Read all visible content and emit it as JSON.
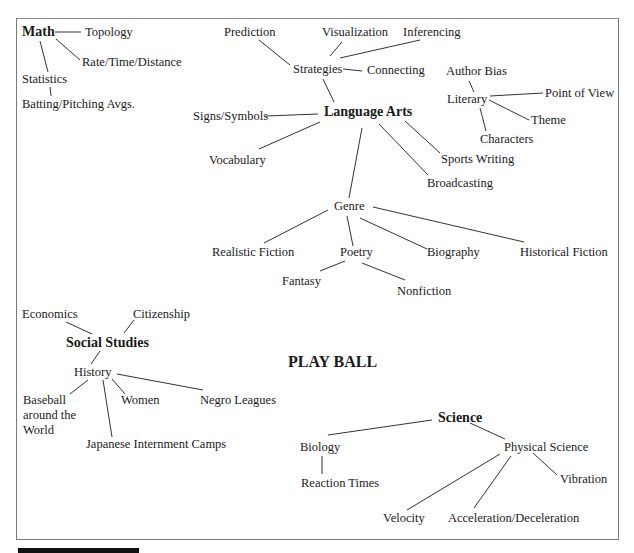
{
  "title": "PLAY BALL",
  "subjects": {
    "math": {
      "label": "Math",
      "children": [
        "Topology",
        "Rate/Time/Distance",
        "Statistics",
        "Batting/Pitching Avgs."
      ]
    },
    "language_arts": {
      "label": "Language Arts",
      "strategies": {
        "label": "Strategies",
        "children": [
          "Prediction",
          "Visualization",
          "Inferencing",
          "Connecting"
        ]
      },
      "literary": {
        "label": "Literary",
        "children": [
          "Author Bias",
          "Point of View",
          "Theme",
          "Characters"
        ]
      },
      "other": [
        "Signs/Symbols",
        "Vocabulary",
        "Sports Writing",
        "Broadcasting"
      ],
      "genre": {
        "label": "Genre",
        "children": [
          "Realistic Fiction",
          "Poetry",
          "Biography",
          "Historical Fiction"
        ],
        "poetry_children": [
          "Fantasy",
          "Nonfiction"
        ]
      }
    },
    "social_studies": {
      "label": "Social Studies",
      "children": [
        "Economics",
        "Citizenship"
      ],
      "history": {
        "label": "History",
        "children": [
          "Baseball around the World",
          "Women",
          "Negro Leagues",
          "Japanese Internment Camps"
        ]
      }
    },
    "science": {
      "label": "Science",
      "biology": {
        "label": "Biology",
        "children": [
          "Reaction Times"
        ]
      },
      "physical_science": {
        "label": "Physical Science",
        "children": [
          "Vibration",
          "Velocity",
          "Acceleration/Deceleration"
        ]
      }
    }
  }
}
